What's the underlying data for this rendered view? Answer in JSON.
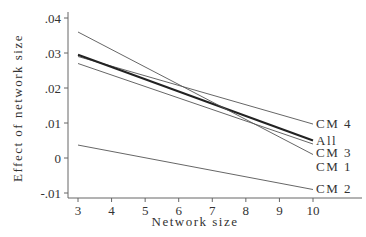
{
  "chart_data": {
    "type": "line",
    "title": "",
    "xlabel": "Network size",
    "ylabel": "Effect of network size",
    "xlim": [
      3,
      10
    ],
    "ylim": [
      -0.01,
      0.04
    ],
    "x_ticks": [
      "3",
      "4",
      "5",
      "6",
      "7",
      "8",
      "9",
      "10"
    ],
    "y_ticks": [
      ".04",
      ".03",
      ".02",
      ".01",
      "0",
      "-.01"
    ],
    "grid": false,
    "legend_position": "inline-right-labels",
    "x": [
      3,
      10
    ],
    "series": [
      {
        "name": "CM 4",
        "values": [
          0.029,
          0.0097
        ],
        "thick": false
      },
      {
        "name": "All",
        "values": [
          0.0295,
          0.005
        ],
        "thick": true
      },
      {
        "name": "CM 3",
        "values": [
          0.027,
          0.004
        ],
        "thick": false
      },
      {
        "name": "CM 1",
        "values": [
          0.036,
          0.001
        ],
        "thick": false
      },
      {
        "name": "CM 2",
        "values": [
          0.0037,
          -0.009
        ],
        "thick": false
      }
    ]
  },
  "labels": {
    "xlabel": "Network size",
    "ylabel": "Effect of network size"
  }
}
